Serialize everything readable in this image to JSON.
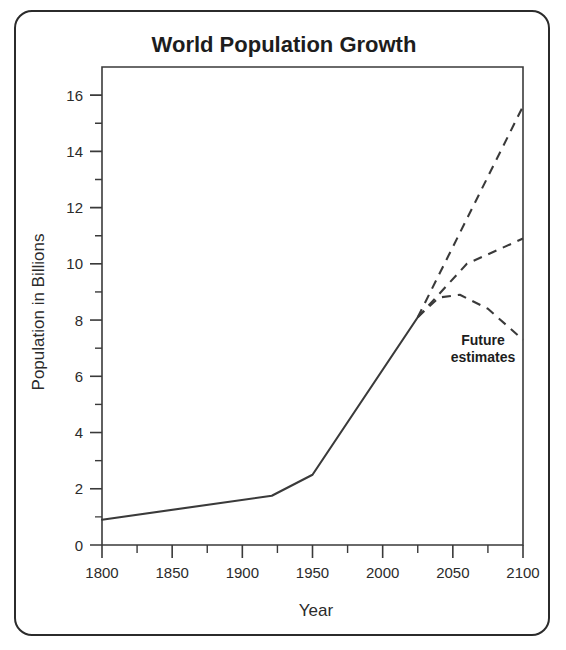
{
  "figure": {
    "title": "World Population Growth",
    "annotation": {
      "line1": "Future",
      "line2": "estimates"
    },
    "frame_color": "#2b2b2b",
    "line_color": "#3a3a3a",
    "background": "#ffffff"
  },
  "chart_data": {
    "type": "line",
    "title": "World Population Growth",
    "xlabel": "Year",
    "ylabel": "Population in Billions",
    "xlim": [
      1800,
      2100
    ],
    "ylim": [
      0,
      17
    ],
    "grid": false,
    "legend": false,
    "x_ticks_major": [
      1800,
      1850,
      1900,
      1950,
      2000,
      2050,
      2100
    ],
    "x_tick_labels": [
      "1800",
      "1850",
      "1900",
      "1950",
      "2000",
      "2050",
      "2100"
    ],
    "x_ticks_minor": [
      1825,
      1875,
      1925,
      1975,
      2025,
      2075
    ],
    "y_ticks_major": [
      0,
      2,
      4,
      6,
      8,
      10,
      12,
      14,
      16
    ],
    "y_tick_labels": [
      "0",
      "2",
      "4",
      "6",
      "8",
      "10",
      "12",
      "14",
      "16"
    ],
    "y_ticks_minor": [
      1,
      3,
      5,
      7,
      9,
      11,
      13,
      15
    ],
    "annotations": [
      {
        "text": "Future estimates",
        "x": 2060,
        "y": 6.8
      }
    ],
    "series": [
      {
        "name": "Historical population",
        "style": "solid",
        "points": [
          [
            1800,
            0.9
          ],
          [
            1921,
            1.75
          ],
          [
            1950,
            2.5
          ],
          [
            2025,
            8.1
          ]
        ]
      },
      {
        "name": "High estimate",
        "style": "dashed",
        "points": [
          [
            2025,
            8.1
          ],
          [
            2100,
            15.6
          ]
        ]
      },
      {
        "name": "Medium estimate",
        "style": "dashed",
        "points": [
          [
            2025,
            8.1
          ],
          [
            2060,
            10.0
          ],
          [
            2100,
            10.9
          ]
        ]
      },
      {
        "name": "Low estimate",
        "style": "dashed",
        "points": [
          [
            2025,
            8.1
          ],
          [
            2040,
            8.8
          ],
          [
            2055,
            8.9
          ],
          [
            2075,
            8.4
          ],
          [
            2100,
            7.3
          ]
        ]
      }
    ]
  }
}
